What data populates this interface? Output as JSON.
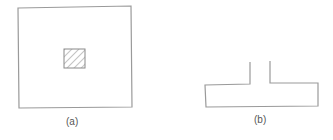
{
  "figure": {
    "panel_a": {
      "label": "(a)",
      "description": "square outline with small hatched square at center"
    },
    "panel_b": {
      "label": "(b)",
      "description": "inverted T-shaped outline (flange with short open stem)"
    },
    "colors": {
      "stroke": "#9a9a9a",
      "hatch": "#8a8a8a",
      "background": "#ffffff",
      "label": "#555555"
    }
  }
}
